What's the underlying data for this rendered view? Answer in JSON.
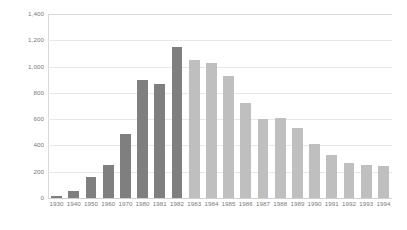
{
  "chart_data": {
    "type": "bar",
    "title": "",
    "subtitle": "",
    "xlabel": "",
    "ylabel": "",
    "categories": [
      "1930",
      "1940",
      "1950",
      "1960",
      "1970",
      "1980",
      "1981",
      "1982",
      "1983",
      "1984",
      "1985",
      "1986",
      "1987",
      "1988",
      "1989",
      "1990",
      "1991",
      "1992",
      "1993",
      "1994"
    ],
    "values": [
      15,
      55,
      160,
      255,
      485,
      895,
      865,
      1150,
      1050,
      1030,
      925,
      720,
      605,
      610,
      535,
      410,
      325,
      265,
      255,
      245
    ],
    "bar_colors": [
      "#7f7f7f",
      "#7f7f7f",
      "#7f7f7f",
      "#7f7f7f",
      "#7f7f7f",
      "#7f7f7f",
      "#7f7f7f",
      "#7f7f7f",
      "#bfbfbf",
      "#bfbfbf",
      "#bfbfbf",
      "#bfbfbf",
      "#bfbfbf",
      "#bfbfbf",
      "#bfbfbf",
      "#bfbfbf",
      "#bfbfbf",
      "#bfbfbf",
      "#bfbfbf",
      "#bfbfbf"
    ],
    "ylim": [
      0,
      1400
    ],
    "ytick_values": [
      0,
      200,
      400,
      600,
      800,
      1000,
      1200,
      1400
    ],
    "ytick_labels": [
      "0",
      "200",
      "400",
      "600",
      "800",
      "1,000",
      "1,200",
      "1,400"
    ],
    "grid": true,
    "grid_axis": "y",
    "legend": false,
    "legend_position": "none",
    "annotations": []
  },
  "colors": {
    "series_dark": "#7f7f7f",
    "series_light": "#bfbfbf",
    "gridline": "#e8e8e8",
    "axis": "#d9d9d9",
    "tick_text": "#7a7a7a",
    "background": "#ffffff"
  }
}
